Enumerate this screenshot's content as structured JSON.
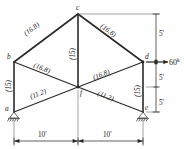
{
  "figure": {
    "units_note": "k",
    "nodes": [
      {
        "id": "a",
        "label": "a",
        "x": 14,
        "y": 112,
        "support": "pin-hatched"
      },
      {
        "id": "b",
        "label": "b",
        "x": 14,
        "y": 62,
        "support": "none"
      },
      {
        "id": "c",
        "label": "c",
        "x": 78,
        "y": 14,
        "support": "none"
      },
      {
        "id": "d",
        "label": "d",
        "x": 143,
        "y": 62,
        "support": "none"
      },
      {
        "id": "e",
        "label": "e",
        "x": 143,
        "y": 112,
        "support": "pin-hatched"
      },
      {
        "id": "f",
        "label": "f",
        "x": 78,
        "y": 87,
        "support": "none"
      }
    ],
    "members": [
      {
        "id": "ab",
        "from": "a",
        "to": "b",
        "label": "(15)",
        "force": 15,
        "orientation": "vertical-left"
      },
      {
        "id": "bc",
        "from": "b",
        "to": "c",
        "label": "(16.8)",
        "force": 16.8,
        "orientation": "diagonal-up-right"
      },
      {
        "id": "cd",
        "from": "c",
        "to": "d",
        "label": "(16.8)",
        "force": 16.8,
        "orientation": "diagonal-down-right"
      },
      {
        "id": "de",
        "from": "d",
        "to": "e",
        "label": "(15)",
        "force": 15,
        "orientation": "vertical-right"
      },
      {
        "id": "cf",
        "from": "c",
        "to": "f",
        "label": "(15)",
        "force": 15,
        "orientation": "vertical-center"
      },
      {
        "id": "bf",
        "from": "b",
        "to": "f",
        "label": "(16.8)",
        "force": 16.8,
        "orientation": "diagonal-down-right"
      },
      {
        "id": "fd",
        "from": "f",
        "to": "d",
        "label": "(16.8)",
        "force": 16.8,
        "orientation": "diagonal-up-right"
      },
      {
        "id": "af",
        "from": "a",
        "to": "f",
        "label": "(11.2)",
        "force": 11.2,
        "orientation": "diagonal-up-right"
      },
      {
        "id": "fe",
        "from": "f",
        "to": "e",
        "label": "(11.2)",
        "force": 11.2,
        "orientation": "diagonal-down-right"
      }
    ],
    "load": {
      "name": "applied-load-at-d",
      "magnitude": "60",
      "unit_superscript": "k",
      "direction": "right",
      "applied_at": "d"
    },
    "vertical_dimensions": [
      {
        "id": "dim-top",
        "label": "5'",
        "value": "5'"
      },
      {
        "id": "dim-middle",
        "label": "5'",
        "value": "5'"
      },
      {
        "id": "dim-bottom",
        "label": "5'",
        "value": "5'"
      }
    ],
    "horizontal_dimensions": [
      {
        "id": "dim-left-span",
        "label": "10'",
        "value": "10'"
      },
      {
        "id": "dim-right-span",
        "label": "10'",
        "value": "10'"
      }
    ],
    "colors": {
      "member": "#2a2a2a",
      "dimension": "#3a3a3a",
      "text": "#1d1d1d",
      "background": "#fefefe"
    }
  }
}
